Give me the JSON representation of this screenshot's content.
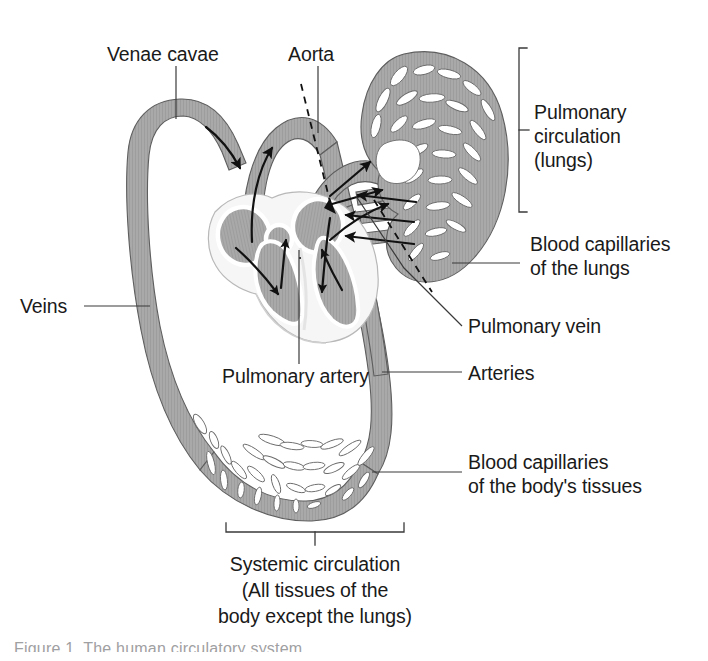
{
  "figure": {
    "background_color": "#ffffff",
    "vessel_fill": "#a8a8a8",
    "vessel_stroke": "#585858",
    "heart_wall": "#f4f4f4",
    "chamber_fill": "#a8a8a8",
    "line_color": "#1a1a1a",
    "label_color": "#1a1a1a"
  },
  "labels": {
    "venae_cavae": "Venae cavae",
    "aorta": "Aorta",
    "veins": "Veins",
    "pulmonary_artery": "Pulmonary artery",
    "pulmonary_vein": "Pulmonary vein",
    "arteries": "Arteries",
    "pulmonary_circulation_l1": "Pulmonary",
    "pulmonary_circulation_l2": "circulation",
    "pulmonary_circulation_l3": "(lungs)",
    "blood_capillaries_lungs_l1": "Blood capillaries",
    "blood_capillaries_lungs_l2": "of the lungs",
    "blood_capillaries_body_l1": "Blood capillaries",
    "blood_capillaries_body_l2": "of the body's tissues",
    "systemic_circulation_l1": "Systemic circulation",
    "systemic_circulation_l2": "(All tissues of the",
    "systemic_circulation_l3": "body except the lungs)",
    "cut_off_caption": "Figure 1  The human circulatory system"
  },
  "brackets": {
    "pulmonary": "Pulmonary circulation (lungs)",
    "systemic": "Systemic circulation (All tissues of the body except the lungs)"
  },
  "flow_arrows": {
    "count": 14,
    "description": "Black arrows indicating direction of blood flow through vessels and heart chambers"
  },
  "dashed_markers": {
    "count": 2,
    "description": "Dashed leader lines pointing at aorta and pulmonary vein vessels"
  }
}
